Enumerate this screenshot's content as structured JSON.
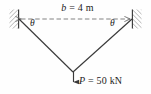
{
  "figure": {
    "background_color": "#fefefe",
    "line_color": "#3a3a3a",
    "dash_color": "#6e6e6e",
    "text_color": "#1c1c1c",
    "hatch_color": "#909090"
  },
  "labels": {
    "span_symbol": "b",
    "span_equals": " = ",
    "span_value": "4 m",
    "span_full": "b = 4 m",
    "load_symbol": "P",
    "load_equals": " = ",
    "load_value": "50 kN",
    "load_full": "P = 50 kN",
    "angle_left": "θ",
    "angle_right": "θ"
  },
  "geometry": {
    "left_anchor_x": 19,
    "left_anchor_y": 19,
    "right_anchor_x": 132,
    "right_anchor_y": 19,
    "apex_x": 73,
    "apex_y": 72,
    "arrow_tip_y": 83,
    "dimension_line_y": 19
  },
  "elements": {
    "left_wall": "hatched fixed support block",
    "right_wall": "hatched fixed support block",
    "left_cable": "straight member from left wall to apex",
    "right_cable": "straight member from right wall to apex",
    "dimension_line": "horizontal dashed double-headed arrow",
    "load_arrow": "vertical downward force arrow at apex"
  }
}
